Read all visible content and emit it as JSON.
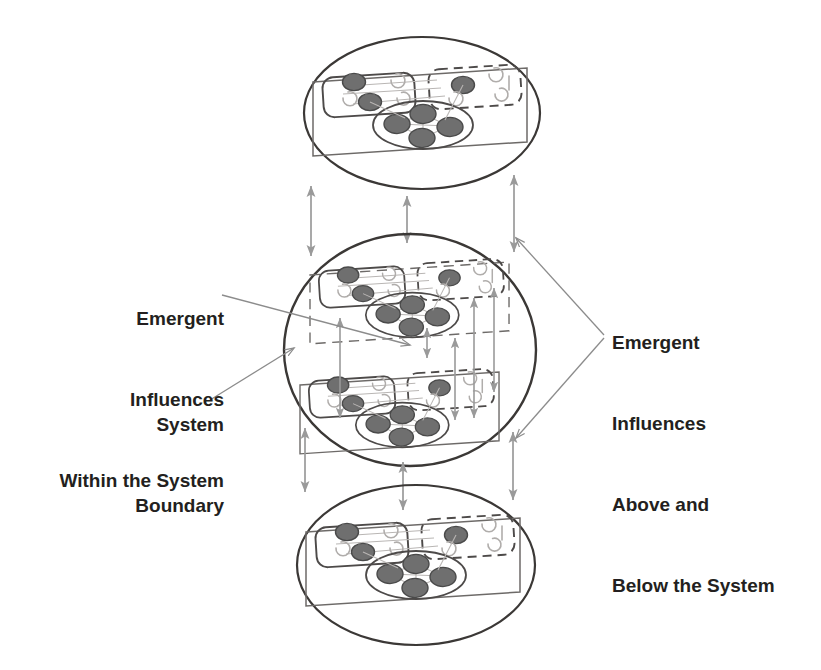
{
  "figure": {
    "type": "nested-systems-diagram",
    "background_color": "#ffffff",
    "ink_color": "#231f20",
    "arrow_color": "#9a9a9a",
    "leader_color": "#8c8c8c",
    "node_fill_color": "#6f6f6f",
    "node_stroke_color": "#4a4a4a"
  },
  "labels": {
    "left_emergent": {
      "name": "emergent-influences-within-the-system",
      "lines": [
        "Emergent",
        "Influences",
        "Within the System"
      ]
    },
    "left_boundary": {
      "name": "system-boundary",
      "lines": [
        "System",
        "Boundary"
      ]
    },
    "right_emergent": {
      "name": "emergent-influences-above-and-below-the-system",
      "lines": [
        "Emergent",
        "Influences",
        "Above and",
        "Below the System"
      ]
    }
  },
  "levels": [
    {
      "id": "level-above",
      "name": "system-level-above",
      "position": "top",
      "ellipse": {
        "cx": 422,
        "cy": 113,
        "rx": 118,
        "ry": 76
      },
      "units": 1,
      "boundary_style": "solid"
    },
    {
      "id": "level-focal",
      "name": "focal-system-level",
      "position": "middle",
      "ellipse": {
        "cx": 410,
        "cy": 350,
        "rx": 126,
        "ry": 116
      },
      "units": 2,
      "boundary_style": "solid"
    },
    {
      "id": "level-below",
      "name": "system-level-below",
      "position": "bottom",
      "ellipse": {
        "cx": 416,
        "cy": 565,
        "rx": 119,
        "ry": 80
      },
      "units": 1,
      "boundary_style": "solid"
    }
  ],
  "unit_template": {
    "name": "system-unit",
    "outer_box": "slanted-rectangle",
    "sub_boxes": [
      {
        "name": "subsystem-box-solid",
        "style": "solid",
        "nodes": 2
      },
      {
        "name": "subsystem-box-dashed",
        "style": "dashed",
        "nodes": 2
      }
    ],
    "cluster_ellipse": {
      "name": "node-cluster",
      "nodes": 5
    }
  },
  "connectors": {
    "between_levels": {
      "name": "inter-level-arrow",
      "style": "double-headed",
      "count": 6,
      "color": "#9a9a9a"
    },
    "within_focal": {
      "name": "intra-system-arrow",
      "style": "double-headed",
      "count": 5,
      "color": "#9a9a9a"
    },
    "leaders": {
      "name": "label-leader-line",
      "count": 4,
      "color": "#8c8c8c"
    }
  }
}
